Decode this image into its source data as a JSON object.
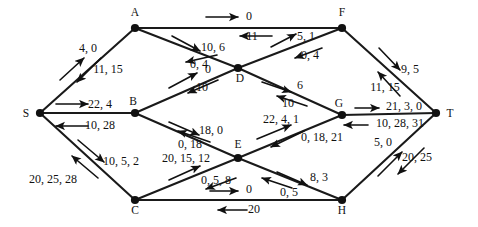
{
  "diagram": {
    "type": "directed-network-flow-diagram",
    "colors": {
      "background": "#ffffff",
      "edge": "#1a1a1a",
      "node": "#111111",
      "text": "#111111"
    },
    "nodes": [
      {
        "id": "A",
        "label": "A",
        "x": 135,
        "y": 28,
        "lx": 135,
        "ly": 16
      },
      {
        "id": "F",
        "label": "F",
        "x": 342,
        "y": 28,
        "lx": 342,
        "ly": 16
      },
      {
        "id": "D",
        "label": "D",
        "x": 238,
        "y": 68,
        "lx": 240,
        "ly": 82
      },
      {
        "id": "S",
        "label": "S",
        "x": 40,
        "y": 113,
        "lx": 26,
        "ly": 117
      },
      {
        "id": "B",
        "label": "B",
        "x": 135,
        "y": 113,
        "lx": 133,
        "ly": 105
      },
      {
        "id": "G",
        "label": "G",
        "x": 342,
        "y": 115,
        "lx": 339,
        "ly": 107
      },
      {
        "id": "T",
        "label": "T",
        "x": 436,
        "y": 113,
        "lx": 450,
        "ly": 117
      },
      {
        "id": "E",
        "label": "E",
        "x": 238,
        "y": 158,
        "lx": 238,
        "ly": 148
      },
      {
        "id": "C",
        "label": "C",
        "x": 135,
        "y": 200,
        "lx": 135,
        "ly": 214
      },
      {
        "id": "H",
        "label": "H",
        "x": 342,
        "y": 200,
        "lx": 342,
        "ly": 214
      }
    ],
    "edges": [
      {
        "id": "S-A",
        "from": "S",
        "to": "A"
      },
      {
        "id": "S-B",
        "from": "S",
        "to": "B"
      },
      {
        "id": "S-C",
        "from": "S",
        "to": "C"
      },
      {
        "id": "A-F",
        "from": "A",
        "to": "F"
      },
      {
        "id": "A-D",
        "from": "A",
        "to": "D"
      },
      {
        "id": "B-D",
        "from": "B",
        "to": "D"
      },
      {
        "id": "B-E",
        "from": "B",
        "to": "E"
      },
      {
        "id": "D-F",
        "from": "D",
        "to": "F"
      },
      {
        "id": "D-G",
        "from": "D",
        "to": "G"
      },
      {
        "id": "C-E",
        "from": "C",
        "to": "E"
      },
      {
        "id": "C-H",
        "from": "C",
        "to": "H"
      },
      {
        "id": "E-G",
        "from": "E",
        "to": "G"
      },
      {
        "id": "E-H",
        "from": "E",
        "to": "H"
      },
      {
        "id": "F-T",
        "from": "F",
        "to": "T"
      },
      {
        "id": "G-T",
        "from": "G",
        "to": "T"
      },
      {
        "id": "H-T",
        "from": "H",
        "to": "T"
      }
    ],
    "edge_labels": [
      {
        "id": "lbl-s-a-up",
        "text": "4, 0",
        "x": 88,
        "y": 52,
        "anchor": "middle"
      },
      {
        "id": "lbl-s-a-down",
        "text": "11, 15",
        "x": 108,
        "y": 73,
        "anchor": "middle"
      },
      {
        "id": "lbl-s-b-up",
        "text": "22, 4",
        "x": 100,
        "y": 108,
        "anchor": "middle"
      },
      {
        "id": "lbl-s-b-down",
        "text": "10, 28",
        "x": 100,
        "y": 129,
        "anchor": "middle"
      },
      {
        "id": "lbl-s-c-down",
        "text": "10, 5, 2",
        "x": 121,
        "y": 165,
        "anchor": "middle"
      },
      {
        "id": "lbl-s-c-up",
        "text": "20, 25, 28",
        "x": 53,
        "y": 183,
        "anchor": "middle"
      },
      {
        "id": "lbl-a-f-up",
        "text": "0",
        "x": 249,
        "y": 20,
        "anchor": "middle"
      },
      {
        "id": "lbl-a-f-down",
        "text": "11",
        "x": 252,
        "y": 40,
        "anchor": "middle"
      },
      {
        "id": "lbl-a-d-up",
        "text": "10, 6",
        "x": 213,
        "y": 51,
        "anchor": "middle"
      },
      {
        "id": "lbl-a-d-down",
        "text": "0, 4",
        "x": 199,
        "y": 68,
        "anchor": "middle"
      },
      {
        "id": "lbl-b-d-up",
        "text": "0",
        "x": 208,
        "y": 73,
        "anchor": "middle"
      },
      {
        "id": "lbl-b-d-down",
        "text": "10",
        "x": 202,
        "y": 91,
        "anchor": "middle"
      },
      {
        "id": "lbl-d-f-up",
        "text": "5, 1",
        "x": 306,
        "y": 40,
        "anchor": "middle"
      },
      {
        "id": "lbl-d-f-down",
        "text": "0, 4",
        "x": 310,
        "y": 59,
        "anchor": "middle"
      },
      {
        "id": "lbl-d-g-up",
        "text": "6",
        "x": 300,
        "y": 89,
        "anchor": "middle"
      },
      {
        "id": "lbl-d-g-down",
        "text": "10",
        "x": 288,
        "y": 107,
        "anchor": "middle"
      },
      {
        "id": "lbl-b-e-up",
        "text": "18, 0",
        "x": 211,
        "y": 134,
        "anchor": "middle"
      },
      {
        "id": "lbl-b-e-down",
        "text": "0, 18",
        "x": 190,
        "y": 148,
        "anchor": "middle"
      },
      {
        "id": "lbl-c-e-up",
        "text": "20, 15, 12",
        "x": 186,
        "y": 162,
        "anchor": "middle"
      },
      {
        "id": "lbl-c-e-down",
        "text": "0, 5, 8",
        "x": 216,
        "y": 184,
        "anchor": "middle"
      },
      {
        "id": "lbl-e-g-up",
        "text": "22, 4, 1",
        "x": 281,
        "y": 123,
        "anchor": "middle"
      },
      {
        "id": "lbl-e-g-down",
        "text": "0, 18, 21",
        "x": 322,
        "y": 141,
        "anchor": "middle"
      },
      {
        "id": "lbl-e-h-up",
        "text": "8, 3",
        "x": 319,
        "y": 181,
        "anchor": "middle"
      },
      {
        "id": "lbl-e-h-down",
        "text": "0, 5",
        "x": 289,
        "y": 196,
        "anchor": "middle"
      },
      {
        "id": "lbl-c-h-up",
        "text": "0",
        "x": 249,
        "y": 193,
        "anchor": "middle"
      },
      {
        "id": "lbl-c-h-down",
        "text": "20",
        "x": 254,
        "y": 213,
        "anchor": "middle"
      },
      {
        "id": "lbl-f-t-right",
        "text": "9, 5",
        "x": 410,
        "y": 73,
        "anchor": "middle"
      },
      {
        "id": "lbl-f-t-left",
        "text": "11, 15",
        "x": 385,
        "y": 91,
        "anchor": "middle"
      },
      {
        "id": "lbl-g-t-up",
        "text": "21, 3, 0",
        "x": 404,
        "y": 110,
        "anchor": "middle"
      },
      {
        "id": "lbl-g-t-down",
        "text": "10, 28, 31",
        "x": 400,
        "y": 127,
        "anchor": "middle"
      },
      {
        "id": "lbl-h-t-up",
        "text": "5, 0",
        "x": 383,
        "y": 146,
        "anchor": "middle"
      },
      {
        "id": "lbl-h-t-down",
        "text": "20, 25",
        "x": 417,
        "y": 161,
        "anchor": "middle"
      }
    ],
    "arrows": [
      {
        "id": "arw-s-a-up",
        "x1": 60,
        "y1": 80,
        "x2": 84,
        "y2": 58
      },
      {
        "id": "arw-s-a-down",
        "x1": 101,
        "y1": 58,
        "x2": 77,
        "y2": 82
      },
      {
        "id": "arw-s-b-up",
        "x1": 56,
        "y1": 104,
        "x2": 88,
        "y2": 104
      },
      {
        "id": "arw-s-b-down",
        "x1": 88,
        "y1": 126,
        "x2": 56,
        "y2": 126
      },
      {
        "id": "arw-s-c-down",
        "x1": 78,
        "y1": 140,
        "x2": 104,
        "y2": 162
      },
      {
        "id": "arw-s-c-up",
        "x1": 98,
        "y1": 178,
        "x2": 72,
        "y2": 156
      },
      {
        "id": "arw-a-f-up",
        "x1": 206,
        "y1": 17,
        "x2": 238,
        "y2": 17
      },
      {
        "id": "arw-a-f-down",
        "x1": 272,
        "y1": 36,
        "x2": 240,
        "y2": 36
      },
      {
        "id": "arw-a-d-up",
        "x1": 172,
        "y1": 36,
        "x2": 200,
        "y2": 51
      },
      {
        "id": "arw-a-d-down",
        "x1": 217,
        "y1": 55,
        "x2": 186,
        "y2": 62
      },
      {
        "id": "arw-b-d-up",
        "x1": 169,
        "y1": 88,
        "x2": 197,
        "y2": 73
      },
      {
        "id": "arw-b-d-down",
        "x1": 218,
        "y1": 80,
        "x2": 188,
        "y2": 93
      },
      {
        "id": "arw-d-f-up",
        "x1": 271,
        "y1": 47,
        "x2": 296,
        "y2": 34
      },
      {
        "id": "arw-d-f-down",
        "x1": 322,
        "y1": 48,
        "x2": 295,
        "y2": 58
      },
      {
        "id": "arw-d-g-up",
        "x1": 262,
        "y1": 82,
        "x2": 291,
        "y2": 92
      },
      {
        "id": "arw-d-g-down",
        "x1": 307,
        "y1": 106,
        "x2": 277,
        "y2": 96
      },
      {
        "id": "arw-b-e-up",
        "x1": 169,
        "y1": 122,
        "x2": 199,
        "y2": 135
      },
      {
        "id": "arw-b-e-down",
        "x1": 210,
        "y1": 142,
        "x2": 178,
        "y2": 131
      },
      {
        "id": "arw-c-e-up",
        "x1": 169,
        "y1": 180,
        "x2": 200,
        "y2": 166
      },
      {
        "id": "arw-c-e-down",
        "x1": 236,
        "y1": 178,
        "x2": 206,
        "y2": 189
      },
      {
        "id": "arw-e-g-up",
        "x1": 257,
        "y1": 139,
        "x2": 291,
        "y2": 125
      },
      {
        "id": "arw-e-g-down",
        "x1": 304,
        "y1": 131,
        "x2": 271,
        "y2": 147
      },
      {
        "id": "arw-e-h-up",
        "x1": 277,
        "y1": 172,
        "x2": 307,
        "y2": 185
      },
      {
        "id": "arw-e-h-down",
        "x1": 292,
        "y1": 188,
        "x2": 262,
        "y2": 178
      },
      {
        "id": "arw-c-h-up",
        "x1": 210,
        "y1": 191,
        "x2": 238,
        "y2": 191
      },
      {
        "id": "arw-c-h-down",
        "x1": 247,
        "y1": 210,
        "x2": 218,
        "y2": 210
      },
      {
        "id": "arw-f-t-right",
        "x1": 379,
        "y1": 48,
        "x2": 400,
        "y2": 70
      },
      {
        "id": "arw-f-t-left",
        "x1": 400,
        "y1": 96,
        "x2": 378,
        "y2": 72
      },
      {
        "id": "arw-g-t-up",
        "x1": 355,
        "y1": 108,
        "x2": 379,
        "y2": 108
      },
      {
        "id": "arw-g-t-down",
        "x1": 368,
        "y1": 125,
        "x2": 344,
        "y2": 125
      },
      {
        "id": "arw-h-t-up",
        "x1": 378,
        "y1": 176,
        "x2": 402,
        "y2": 152
      },
      {
        "id": "arw-h-t-down",
        "x1": 424,
        "y1": 148,
        "x2": 398,
        "y2": 174
      }
    ]
  }
}
